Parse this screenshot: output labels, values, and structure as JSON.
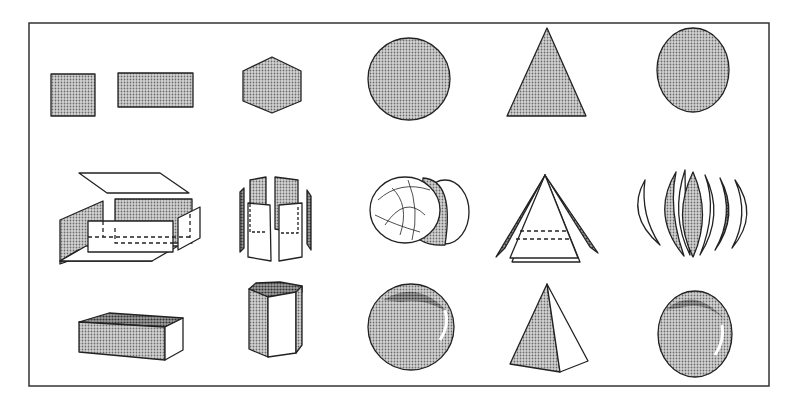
{
  "diagram": {
    "colors": {
      "stroke": "#222222",
      "fill_light": "#bdbdbd",
      "fill_dark": "#8a8a8a",
      "background": "#ffffff"
    },
    "columns": [
      {
        "id": "rectangle",
        "shape_2d": "square and rectangle",
        "exploded": "box faces",
        "solid_3d": "rectangular prism"
      },
      {
        "id": "hexagon",
        "shape_2d": "hexagon",
        "exploded": "hexagonal prism faces",
        "solid_3d": "hexagonal prism"
      },
      {
        "id": "circle",
        "shape_2d": "circle",
        "exploded": "sphere sections",
        "solid_3d": "sphere"
      },
      {
        "id": "triangle",
        "shape_2d": "triangle",
        "exploded": "pyramid faces",
        "solid_3d": "pyramid"
      },
      {
        "id": "ellipse",
        "shape_2d": "ellipse",
        "exploded": "ellipsoid segments",
        "solid_3d": "ellipsoid"
      }
    ],
    "rows": [
      "2D shapes",
      "exploded surfaces",
      "3D solids"
    ]
  }
}
